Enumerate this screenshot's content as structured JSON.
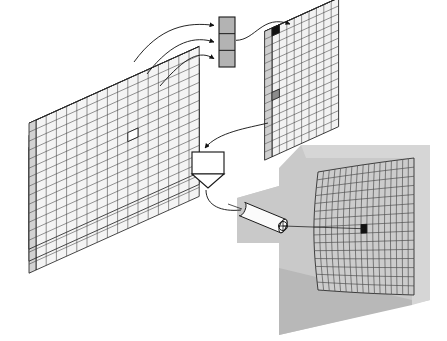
{
  "figure": {
    "background_color": "#ffffff",
    "stroke_color": "#1a1a1a",
    "canvas": {
      "width": 447,
      "height": 341
    }
  },
  "palette": {
    "line": "#1a1a1a",
    "grid_line": "#3c3c3c",
    "slab_face": "#f4f4f4",
    "slab_top": "#e2e2e2",
    "slab_side": "#d2d2d2",
    "buffer_fill": "#b3b3b3",
    "panel_face": "#f2f2f2",
    "panel_top": "#dcdcdc",
    "panel_side": "#cfcfcf",
    "funnel_fill": "#ffffff",
    "housing_fill": "#c9c9c9",
    "housing_shadow": "#b8b8b8",
    "housing_light": "#d6d6d6",
    "lens_fill": "#fbfbfb",
    "marker_light": "#ffffff",
    "marker_dark": "#111111",
    "detector_fill": "#cccccc"
  },
  "stacked_slabs": {
    "name": "stacked-voxel-slabs",
    "count": 3,
    "columns": 16,
    "rows": 14,
    "depth_cells": 1,
    "offset_x": -12,
    "offset_y": -12,
    "highlighted_cell": {
      "col": 9,
      "row": 6,
      "fill": "#ffffff"
    }
  },
  "buffer_stack": {
    "name": "buffer-cell-stack",
    "cells": 3,
    "x": 219,
    "y": 17,
    "width": 16,
    "height": 50,
    "fill": "#b3b3b3"
  },
  "panel": {
    "name": "projection-panel",
    "columns": 9,
    "rows": 16,
    "entry_marker": {
      "label": "top-left-cell",
      "fill": "#111111"
    },
    "exit_marker": {
      "label": "left-edge-cell",
      "fill": "#8c8c8c"
    }
  },
  "funnel": {
    "name": "processing-funnel",
    "box": {
      "x": 192,
      "y": 152,
      "width": 32,
      "height": 22
    },
    "spout_depth": 14
  },
  "detector_assembly": {
    "name": "detector-housing",
    "lens": {
      "name": "lens-barrel",
      "length": 42,
      "radius": 7
    },
    "aperture": {
      "name": "aperture-circle",
      "radius": 4.5
    },
    "surface": {
      "name": "curved-detector-grid",
      "columns": 17,
      "rows": 15,
      "target_marker": {
        "label": "hit-cell",
        "fill": "#111111"
      }
    }
  },
  "connectors": [
    {
      "name": "slab-1-to-buffer-cell-1",
      "type": "arrow-curve"
    },
    {
      "name": "slab-2-to-buffer-cell-2",
      "type": "arrow-curve"
    },
    {
      "name": "slab-3-to-buffer-cell-3",
      "type": "arrow-curve"
    },
    {
      "name": "buffer-to-panel",
      "type": "arrow-curve"
    },
    {
      "name": "panel-to-funnel",
      "type": "arrow-curve"
    },
    {
      "name": "funnel-to-lens",
      "type": "plain-curve"
    },
    {
      "name": "lens-to-detector-target",
      "type": "sight-line"
    }
  ]
}
